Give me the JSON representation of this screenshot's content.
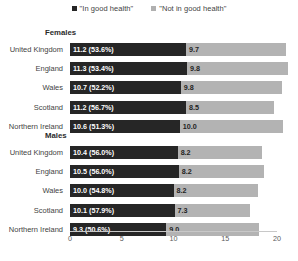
{
  "legend": {
    "items": [
      {
        "label": "\"In good health\"",
        "icon": "square-marker-dark",
        "color": "#262626"
      },
      {
        "label": "\"Not in good health\"",
        "icon": "square-marker-light",
        "color": "#b0b0b0"
      }
    ]
  },
  "groups": [
    {
      "title": "Females"
    },
    {
      "title": "Males"
    }
  ],
  "axis": {
    "ticks": [
      "0",
      "5",
      "10",
      "15",
      "20"
    ]
  },
  "chart_data": {
    "type": "bar",
    "orientation": "horizontal",
    "stacked": true,
    "title": "",
    "xlabel": "",
    "ylabel": "",
    "xlim": [
      0,
      20
    ],
    "xticks": [
      0,
      5,
      10,
      15,
      20
    ],
    "grid": false,
    "legend_position": "top-center",
    "series": [
      {
        "name": "\"In good health\"",
        "color": "#262626"
      },
      {
        "name": "\"Not in good health\"",
        "color": "#b3b3b3"
      }
    ],
    "panels": [
      {
        "title": "Females",
        "categories": [
          "United Kingdom",
          "England",
          "Wales",
          "Scotland",
          "Northern Ireland"
        ],
        "rows": [
          {
            "category": "United Kingdom",
            "in_good_health": 11.2,
            "in_good_health_pct": "53.6%",
            "in_good_health_label": "11.2 (53.6%)",
            "not_in_good_health": 9.7,
            "not_in_good_health_label": "9.7"
          },
          {
            "category": "England",
            "in_good_health": 11.3,
            "in_good_health_pct": "53.4%",
            "in_good_health_label": "11.3 (53.4%)",
            "not_in_good_health": 9.8,
            "not_in_good_health_label": "9.8"
          },
          {
            "category": "Wales",
            "in_good_health": 10.7,
            "in_good_health_pct": "52.2%",
            "in_good_health_label": "10.7 (52.2%)",
            "not_in_good_health": 9.8,
            "not_in_good_health_label": "9.8"
          },
          {
            "category": "Scotland",
            "in_good_health": 11.2,
            "in_good_health_pct": "56.7%",
            "in_good_health_label": "11.2 (56.7%)",
            "not_in_good_health": 8.5,
            "not_in_good_health_label": "8.5"
          },
          {
            "category": "Northern Ireland",
            "in_good_health": 10.6,
            "in_good_health_pct": "51.3%",
            "in_good_health_label": "10.6 (51.3%)",
            "not_in_good_health": 10.0,
            "not_in_good_health_label": "10.0"
          }
        ]
      },
      {
        "title": "Males",
        "categories": [
          "United Kingdom",
          "England",
          "Wales",
          "Scotland",
          "Northern Ireland"
        ],
        "rows": [
          {
            "category": "United Kingdom",
            "in_good_health": 10.4,
            "in_good_health_pct": "56.0%",
            "in_good_health_label": "10.4 (56.0%)",
            "not_in_good_health": 8.2,
            "not_in_good_health_label": "8.2"
          },
          {
            "category": "England",
            "in_good_health": 10.5,
            "in_good_health_pct": "56.0%",
            "in_good_health_label": "10.5 (56.0%)",
            "not_in_good_health": 8.2,
            "not_in_good_health_label": "8.2"
          },
          {
            "category": "Wales",
            "in_good_health": 10.0,
            "in_good_health_pct": "54.8%",
            "in_good_health_label": "10.0 (54.8%)",
            "not_in_good_health": 8.2,
            "not_in_good_health_label": "8.2"
          },
          {
            "category": "Scotland",
            "in_good_health": 10.1,
            "in_good_health_pct": "57.9%",
            "in_good_health_label": "10.1 (57.9%)",
            "not_in_good_health": 7.3,
            "not_in_good_health_label": "7.3"
          },
          {
            "category": "Northern Ireland",
            "in_good_health": 9.3,
            "in_good_health_pct": "50.6%",
            "in_good_health_label": "9.3 (50.6%)",
            "not_in_good_health": 9.0,
            "not_in_good_health_label": "9.0"
          }
        ]
      }
    ]
  }
}
